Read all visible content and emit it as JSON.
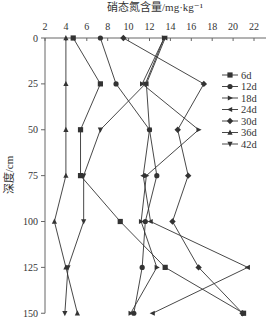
{
  "chart_data": {
    "type": "line",
    "title": "",
    "xlabel": "硝态氮含量/mg·kg⁻¹",
    "ylabel": "深度/cm",
    "x_axis_position": "top",
    "y_axis_inverted": true,
    "xlim": [
      2,
      23
    ],
    "ylim": [
      0,
      150
    ],
    "x_ticks": [
      2,
      4,
      6,
      8,
      10,
      12,
      14,
      16,
      18,
      20,
      22
    ],
    "y_ticks": [
      0,
      25,
      50,
      75,
      100,
      125,
      150
    ],
    "depths": [
      0,
      25,
      50,
      75,
      100,
      125,
      150
    ],
    "grid": false,
    "legend_position": "right",
    "series": [
      {
        "name": "6d",
        "marker": "square",
        "values": [
          4.7,
          7.3,
          5.4,
          5.4,
          9.2,
          13.5,
          21.0
        ]
      },
      {
        "name": "12d",
        "marker": "circle",
        "values": [
          7.3,
          8.8,
          12.0,
          12.7,
          11.6,
          11.3,
          10.5
        ]
      },
      {
        "name": "18d",
        "marker": "triangle-right",
        "values": [
          13.4,
          11.3,
          16.7,
          11.7,
          11.2,
          12.7,
          10.2
        ]
      },
      {
        "name": "24d",
        "marker": "triangle-left",
        "values": [
          13.5,
          11.7,
          12.0,
          11.4,
          12.1,
          21.4,
          12.3
        ]
      },
      {
        "name": "30d",
        "marker": "diamond",
        "values": [
          9.5,
          17.2,
          14.7,
          15.7,
          14.2,
          16.7,
          20.9
        ]
      },
      {
        "name": "36d",
        "marker": "triangle-up",
        "values": [
          4.0,
          4.0,
          4.0,
          4.0,
          2.9,
          4.0,
          5.1
        ]
      },
      {
        "name": "42d",
        "marker": "triangle-down",
        "values": [
          13.4,
          11.6,
          7.3,
          5.7,
          5.7,
          4.2,
          3.9
        ]
      }
    ]
  },
  "colors": {
    "line": "#333333",
    "axis": "#666666"
  }
}
